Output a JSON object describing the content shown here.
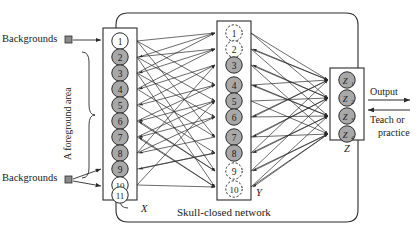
{
  "diagram": {
    "title": "Skull-closed network",
    "outer_box_label": "Skull-closed network",
    "colors": {
      "node_fill_active": "#a8a8a8",
      "node_fill_inactive": "#ffffff",
      "stroke": "#2b2b2b",
      "marker_fill": "#8a8a8a",
      "background": "#ffffff"
    },
    "labels": {
      "backgrounds_top": "Backgrounds",
      "backgrounds_bottom": "Backgrounds",
      "foreground_area": "A foreground area",
      "layer_x": "X",
      "layer_y": "Y",
      "layer_z": "Z",
      "output": "Output",
      "teach_line1": "Teach or",
      "teach_line2": "practice",
      "arrow_right": "→",
      "arrow_left": "←"
    },
    "layers": [
      {
        "id": "X",
        "name": "X",
        "label": "X",
        "node_count": 11,
        "nodes": [
          {
            "label": "1",
            "state": "inactive",
            "border": "solid"
          },
          {
            "label": "2",
            "state": "active",
            "border": "solid"
          },
          {
            "label": "3",
            "state": "active",
            "border": "solid"
          },
          {
            "label": "4",
            "state": "active",
            "border": "solid"
          },
          {
            "label": "5",
            "state": "active",
            "border": "solid"
          },
          {
            "label": "6",
            "state": "active",
            "border": "solid"
          },
          {
            "label": "7",
            "state": "active",
            "border": "solid"
          },
          {
            "label": "8",
            "state": "active",
            "border": "solid"
          },
          {
            "label": "9",
            "state": "active",
            "border": "solid"
          },
          {
            "label": "10",
            "state": "inactive",
            "border": "solid"
          },
          {
            "label": "11",
            "state": "inactive",
            "border": "solid"
          }
        ]
      },
      {
        "id": "Y",
        "name": "Y",
        "label": "Y",
        "node_count": 10,
        "nodes": [
          {
            "label": "1",
            "state": "inactive",
            "border": "dashed"
          },
          {
            "label": "2",
            "state": "inactive",
            "border": "dashed"
          },
          {
            "label": "3",
            "state": "active",
            "border": "solid"
          },
          {
            "label": "4",
            "state": "active",
            "border": "solid"
          },
          {
            "label": "5",
            "state": "active",
            "border": "solid"
          },
          {
            "label": "6",
            "state": "active",
            "border": "solid"
          },
          {
            "label": "7",
            "state": "active",
            "border": "solid"
          },
          {
            "label": "8",
            "state": "active",
            "border": "solid"
          },
          {
            "label": "9",
            "state": "inactive",
            "border": "dashed"
          },
          {
            "label": "10",
            "state": "inactive",
            "border": "dashed"
          }
        ]
      },
      {
        "id": "Z",
        "name": "Z",
        "label": "Z",
        "node_count": 4,
        "nodes": [
          {
            "label": "Z",
            "sub": "1",
            "state": "active",
            "border": "solid"
          },
          {
            "label": "Z",
            "sub": "2",
            "state": "active",
            "border": "solid"
          },
          {
            "label": "Z",
            "sub": "3",
            "state": "active",
            "border": "solid"
          },
          {
            "label": "Z",
            "sub": "4",
            "state": "active",
            "border": "solid"
          }
        ]
      }
    ],
    "annotations": {
      "foreground_group_nodes": "2-9",
      "background_top_node": "1",
      "background_bottom_nodes": "10, 11"
    }
  }
}
